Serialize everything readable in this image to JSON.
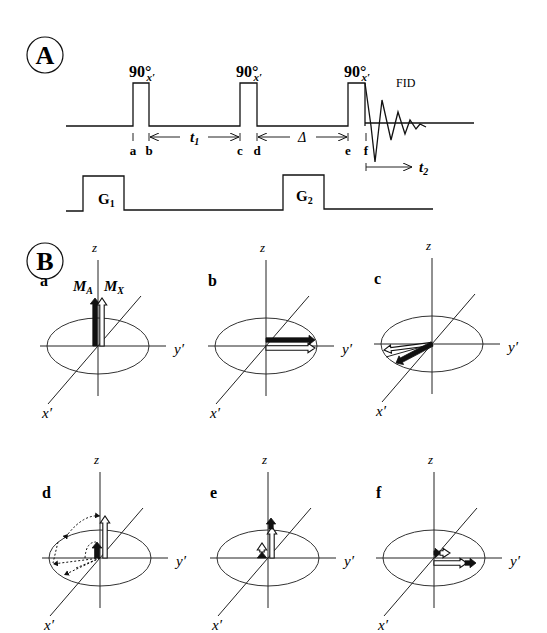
{
  "panel_A": {
    "label": "A",
    "pulses": [
      {
        "label": "90",
        "deg": "°",
        "sub": "x′"
      },
      {
        "label": "90",
        "deg": "°",
        "sub": "x′"
      },
      {
        "label": "90",
        "deg": "°",
        "sub": "x′"
      }
    ],
    "fid_label": "FID",
    "timepoints": [
      "a",
      "b",
      "c",
      "d",
      "e",
      "f"
    ],
    "intervals": {
      "t1": "t",
      "t1_sub": "1",
      "delta": "Δ",
      "t2": "t",
      "t2_sub": "2"
    },
    "gradients": [
      {
        "label": "G",
        "sub": "1"
      },
      {
        "label": "G",
        "sub": "2"
      }
    ]
  },
  "panel_B": {
    "label": "B",
    "axis_labels": {
      "z": "z",
      "y": "y′",
      "x": "x′"
    },
    "vector_labels": {
      "MA": "M",
      "MA_sub": "A",
      "MX": "M",
      "MX_sub": "X"
    },
    "subpanels": [
      {
        "id": "a",
        "label": "a"
      },
      {
        "id": "b",
        "label": "b"
      },
      {
        "id": "c",
        "label": "c"
      },
      {
        "id": "d",
        "label": "d"
      },
      {
        "id": "e",
        "label": "e"
      },
      {
        "id": "f",
        "label": "f"
      }
    ]
  }
}
